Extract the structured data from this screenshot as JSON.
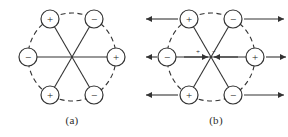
{
  "figure": {
    "background_color": "#ffffff",
    "stroke_color": "#333333",
    "panels": [
      {
        "id": "a",
        "caption": "(a)",
        "center": {
          "x": 72,
          "y": 57
        },
        "ring_radius": 44,
        "charge_radius": 9,
        "ring_style": "dashed",
        "has_field_arrows": false,
        "charges": [
          {
            "label": "+",
            "name": "charge-top-left",
            "angle_deg": 120,
            "x": 50,
            "y": 19
          },
          {
            "label": "−",
            "name": "charge-top-right",
            "angle_deg": 60,
            "x": 94,
            "y": 19
          },
          {
            "label": "+",
            "name": "charge-right",
            "angle_deg": 0,
            "x": 116,
            "y": 57
          },
          {
            "label": "−",
            "name": "charge-bottom-right",
            "angle_deg": 300,
            "x": 94,
            "y": 95
          },
          {
            "label": "+",
            "name": "charge-bottom-left",
            "angle_deg": 240,
            "x": 50,
            "y": 95
          },
          {
            "label": "−",
            "name": "charge-left",
            "angle_deg": 180,
            "x": 28,
            "y": 57
          }
        ]
      },
      {
        "id": "b",
        "caption": "(b)",
        "center": {
          "x": 67,
          "y": 57
        },
        "ring_radius": 44,
        "charge_radius": 9,
        "ring_style": "dashed",
        "has_field_arrows": true,
        "center_labels": [
          {
            "label": "+",
            "name": "center-plus-label",
            "x": 54,
            "y": 54
          },
          {
            "label": "−",
            "name": "center-minus-label",
            "x": 70,
            "y": 54
          }
        ],
        "charges": [
          {
            "label": "+",
            "name": "charge-top-left",
            "angle_deg": 120,
            "x": 45,
            "y": 19
          },
          {
            "label": "−",
            "name": "charge-top-right",
            "angle_deg": 60,
            "x": 89,
            "y": 19
          },
          {
            "label": "+",
            "name": "charge-right",
            "angle_deg": 0,
            "x": 111,
            "y": 57
          },
          {
            "label": "−",
            "name": "charge-bottom-right",
            "angle_deg": 300,
            "x": 89,
            "y": 95
          },
          {
            "label": "+",
            "name": "charge-bottom-left",
            "angle_deg": 240,
            "x": 45,
            "y": 95
          },
          {
            "label": "−",
            "name": "charge-left",
            "angle_deg": 180,
            "x": 23,
            "y": 57
          }
        ],
        "field_arrows": [
          {
            "name": "arrow-top-left",
            "direction": "left",
            "x1": 34,
            "y1": 19,
            "x2": 2,
            "y2": 19
          },
          {
            "name": "arrow-top-right",
            "direction": "right",
            "x1": 100,
            "y1": 19,
            "x2": 140,
            "y2": 19
          },
          {
            "name": "arrow-middle-left",
            "direction": "left",
            "x1": 13,
            "y1": 57,
            "x2": 2,
            "y2": 57
          },
          {
            "name": "arrow-middle-right",
            "direction": "right",
            "x1": 122,
            "y1": 57,
            "x2": 142,
            "y2": 57
          },
          {
            "name": "arrow-bottom-left",
            "direction": "left",
            "x1": 34,
            "y1": 95,
            "x2": 2,
            "y2": 95
          },
          {
            "name": "arrow-bottom-right",
            "direction": "right",
            "x1": 100,
            "y1": 95,
            "x2": 140,
            "y2": 95
          }
        ],
        "center_arrows": [
          {
            "name": "center-arrow-from-left",
            "direction": "right",
            "x1": 40,
            "y1": 57,
            "x2": 64,
            "y2": 57
          },
          {
            "name": "center-arrow-from-right",
            "direction": "left",
            "x1": 94,
            "y1": 57,
            "x2": 70,
            "y2": 57
          }
        ]
      }
    ]
  }
}
